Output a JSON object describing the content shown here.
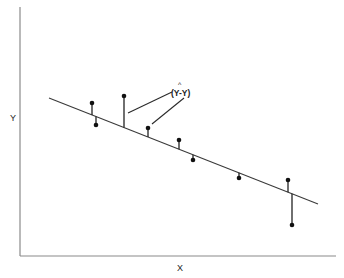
{
  "diagram": {
    "axes": {
      "x_label": "X",
      "y_label": "Y",
      "origin": [
        20,
        256
      ],
      "x_end": [
        336,
        256
      ],
      "y_end": [
        20,
        7
      ]
    },
    "regression_line": {
      "start": [
        49,
        98
      ],
      "end": [
        318,
        204
      ]
    },
    "annotation": {
      "hat": "^",
      "text": "(Y-Y)",
      "full_label": "(Ŷ-Y)",
      "position": [
        175,
        95
      ],
      "leaders": [
        {
          "from": [
            128,
            113
          ],
          "to": [
            172,
            92
          ]
        },
        {
          "from": [
            152,
            124
          ],
          "to": [
            184,
            98
          ]
        }
      ]
    },
    "points": [
      {
        "id": 1,
        "x": 92,
        "y": 103,
        "side": "above"
      },
      {
        "id": 2,
        "x": 96,
        "y": 125,
        "side": "below"
      },
      {
        "id": 3,
        "x": 124,
        "y": 96,
        "side": "above"
      },
      {
        "id": 4,
        "x": 148,
        "y": 128,
        "side": "above"
      },
      {
        "id": 5,
        "x": 179,
        "y": 140,
        "side": "above"
      },
      {
        "id": 6,
        "x": 193,
        "y": 160,
        "side": "below"
      },
      {
        "id": 7,
        "x": 239,
        "y": 178,
        "side": "below"
      },
      {
        "id": 8,
        "x": 288,
        "y": 180,
        "side": "above"
      },
      {
        "id": 9,
        "x": 292,
        "y": 225,
        "side": "below"
      }
    ],
    "colors": {
      "axis": "#8a8a8a",
      "line": "#3a3a3a",
      "points": "#111111",
      "background": "#ffffff"
    }
  }
}
